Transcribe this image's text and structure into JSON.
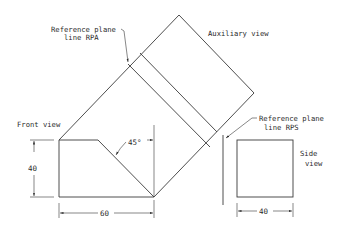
{
  "diagram": {
    "labels": {
      "reference_plane_rpa_line1": "Reference plane",
      "reference_plane_rpa_line2": "line RPA",
      "auxiliary_view": "Auxiliary view",
      "front_view": "Front view",
      "reference_plane_rps_line1": "Reference plane",
      "reference_plane_rps_line2": "line RPS",
      "side_view_line1": "Side",
      "side_view_line2": "view"
    },
    "dimensions": {
      "front_height": "40",
      "front_width": "60",
      "chamfer_angle": "45°",
      "side_width": "40"
    },
    "colors": {
      "line": "#3a3a3a",
      "background": "#ffffff"
    }
  }
}
